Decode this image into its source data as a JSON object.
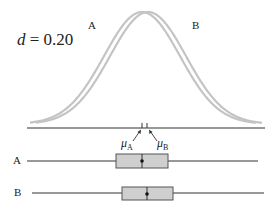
{
  "figure": {
    "effect_size_symbol": "d",
    "effect_size_equals": " = ",
    "effect_size_value": "0.20",
    "curve_labels": {
      "a": "A",
      "b": "B"
    },
    "mean_labels": {
      "a": {
        "symbol": "μ",
        "subscript": "A"
      },
      "b": {
        "symbol": "μ",
        "subscript": "B"
      }
    },
    "boxplots": [
      {
        "label": "A",
        "whisker_min_x": 27,
        "q1_x": 116,
        "median_x": 142,
        "q3_x": 168,
        "whisker_max_x": 258,
        "y": 161
      },
      {
        "label": "B",
        "whisker_min_x": 32,
        "q1_x": 122,
        "median_x": 147,
        "q3_x": 173,
        "whisker_max_x": 264,
        "y": 193
      }
    ],
    "colors": {
      "curve": "#c4c4c4",
      "line": "#333333",
      "box_fill": "#cfcfcf",
      "box_stroke": "#555555"
    }
  },
  "chart_data": {
    "type": "diagram",
    "title": "d = 0.20",
    "series": [
      {
        "name": "A",
        "mean_x_px": 142,
        "distribution": "normal"
      },
      {
        "name": "B",
        "mean_x_px": 147,
        "distribution": "normal"
      }
    ],
    "effect_size": 0.2,
    "annotations": [
      "μA",
      "μB",
      "A",
      "B"
    ]
  }
}
